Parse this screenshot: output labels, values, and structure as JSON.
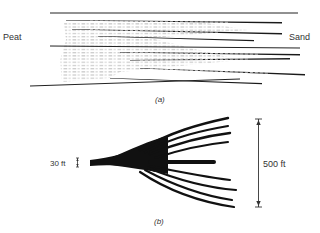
{
  "figure_a": {
    "caption": "(a)",
    "left_label": "Peat",
    "right_label": "Sand"
  },
  "figure_b": {
    "caption": "(b)",
    "thickness_label": "30 ft",
    "height_label": "500 ft"
  },
  "colors": {
    "ink": "#111111",
    "text": "#333333",
    "dash": "#8a8a8a",
    "background": "#ffffff"
  }
}
